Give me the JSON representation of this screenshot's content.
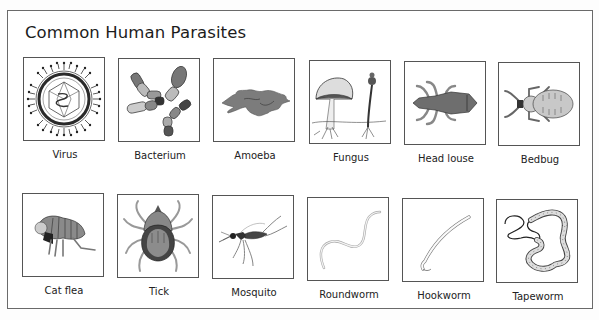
{
  "page": {
    "title": "Common Human Parasites"
  },
  "parasites": [
    {
      "label": "Virus",
      "icon": "virus-icon"
    },
    {
      "label": "Bacterium",
      "icon": "bacterium-icon"
    },
    {
      "label": "Amoeba",
      "icon": "amoeba-icon"
    },
    {
      "label": "Fungus",
      "icon": "fungus-icon"
    },
    {
      "label": "Head louse",
      "icon": "head-louse-icon"
    },
    {
      "label": "Bedbug",
      "icon": "bedbug-icon"
    },
    {
      "label": "Cat flea",
      "icon": "cat-flea-icon"
    },
    {
      "label": "Tick",
      "icon": "tick-icon"
    },
    {
      "label": "Mosquito",
      "icon": "mosquito-icon"
    },
    {
      "label": "Roundworm",
      "icon": "roundworm-icon"
    },
    {
      "label": "Hookworm",
      "icon": "hookworm-icon"
    },
    {
      "label": "Tapeworm",
      "icon": "tapeworm-icon"
    }
  ],
  "colors": {
    "frame_border": "#6a6a6a",
    "box_border": "#555555",
    "illustration_dark": "#3a3a3a",
    "illustration_mid": "#7a7a7a",
    "illustration_light": "#c4c4c4"
  }
}
